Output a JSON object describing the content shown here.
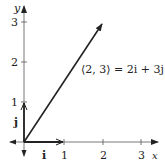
{
  "diagram": {
    "axes": {
      "x_label": "x",
      "y_label": "y",
      "x_ticks": [
        "1",
        "2",
        "3"
      ],
      "y_ticks": [
        "1",
        "2",
        "3"
      ]
    },
    "unit_vectors": {
      "i_label": "i",
      "j_label": "j"
    },
    "vector": {
      "components": [
        2,
        3
      ],
      "label": "⟨2, 3⟩ = 2i + 3j"
    },
    "colors": {
      "ink": "#222222",
      "axis": "#444444",
      "background": "#ffffff"
    }
  }
}
